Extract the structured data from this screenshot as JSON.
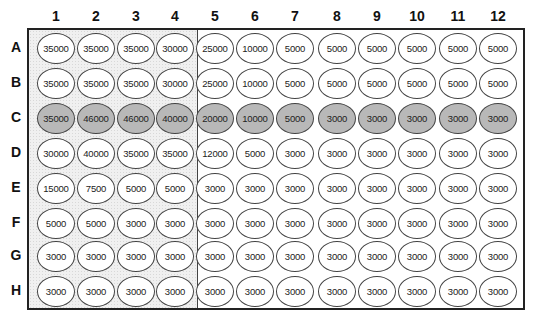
{
  "plate": {
    "columns": [
      "1",
      "2",
      "3",
      "4",
      "5",
      "6",
      "7",
      "8",
      "9",
      "10",
      "11",
      "12"
    ],
    "rows": [
      "A",
      "B",
      "C",
      "D",
      "E",
      "F",
      "G",
      "H"
    ],
    "shaded_columns_region": [
      "1",
      "2",
      "3",
      "4"
    ],
    "highlighted_row": "C",
    "colors": {
      "highlight_well": "#b8b8b8",
      "shaded_region": "#f0f0f0",
      "border": "#222222"
    },
    "values": [
      [
        "35000",
        "35000",
        "35000",
        "30000",
        "25000",
        "10000",
        "5000",
        "5000",
        "5000",
        "5000",
        "5000",
        "5000"
      ],
      [
        "35000",
        "35000",
        "35000",
        "30000",
        "25000",
        "10000",
        "5000",
        "5000",
        "5000",
        "5000",
        "5000",
        "5000"
      ],
      [
        "35000",
        "46000",
        "46000",
        "40000",
        "20000",
        "10000",
        "5000",
        "3000",
        "3000",
        "3000",
        "3000",
        "3000"
      ],
      [
        "30000",
        "40000",
        "35000",
        "35000",
        "12000",
        "5000",
        "3000",
        "3000",
        "3000",
        "3000",
        "3000",
        "3000"
      ],
      [
        "15000",
        "7500",
        "5000",
        "5000",
        "3000",
        "3000",
        "3000",
        "3000",
        "3000",
        "3000",
        "3000",
        "3000"
      ],
      [
        "5000",
        "5000",
        "3000",
        "3000",
        "3000",
        "3000",
        "3000",
        "3000",
        "3000",
        "3000",
        "3000",
        "3000"
      ],
      [
        "3000",
        "3000",
        "3000",
        "3000",
        "3000",
        "3000",
        "3000",
        "3000",
        "3000",
        "3000",
        "3000",
        "3000"
      ],
      [
        "3000",
        "3000",
        "3000",
        "3000",
        "3000",
        "3000",
        "3000",
        "3000",
        "3000",
        "3000",
        "3000",
        "3000"
      ]
    ]
  }
}
